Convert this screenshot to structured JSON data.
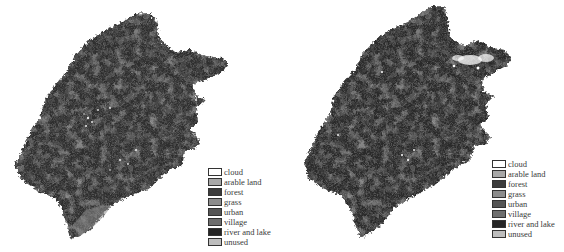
{
  "figure": {
    "panels": [
      {
        "id": "left",
        "legend": [
          {
            "label": "cloud",
            "color": "#ffffff"
          },
          {
            "label": "arable land",
            "color": "#a8a8a8"
          },
          {
            "label": "forest",
            "color": "#3c3c3c"
          },
          {
            "label": "grass",
            "color": "#8c8c8c"
          },
          {
            "label": "urban",
            "color": "#555555"
          },
          {
            "label": "village",
            "color": "#6e6e6e"
          },
          {
            "label": "river and lake",
            "color": "#262626"
          },
          {
            "label": "unused",
            "color": "#bdbdbd"
          }
        ]
      },
      {
        "id": "right",
        "legend": [
          {
            "label": "cloud",
            "color": "#ffffff"
          },
          {
            "label": "arable land",
            "color": "#a8a8a8"
          },
          {
            "label": "forest",
            "color": "#3c3c3c"
          },
          {
            "label": "grass",
            "color": "#8c8c8c"
          },
          {
            "label": "urban",
            "color": "#555555"
          },
          {
            "label": "village",
            "color": "#6e6e6e"
          },
          {
            "label": "river and lake",
            "color": "#262626"
          },
          {
            "label": "unused",
            "color": "#bdbdbd"
          }
        ]
      }
    ]
  },
  "colors": {
    "map_base": "#2e2e2e",
    "map_mid": "#4a4a4a",
    "map_dark": "#1c1c1c",
    "cloud": "#ffffff",
    "coast_light": "#9a9a9a"
  }
}
